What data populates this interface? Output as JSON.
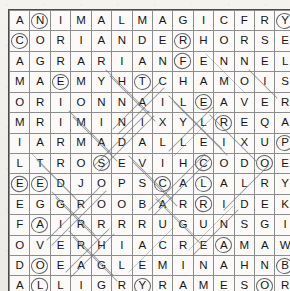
{
  "puzzle": {
    "type": "word-search",
    "rows": 14,
    "cols": 14,
    "title": "Animal Magic word search grid",
    "grid": [
      [
        "A",
        "N",
        "I",
        "M",
        "A",
        "L",
        "M",
        "A",
        "G",
        "I",
        "C",
        "F",
        "R",
        "Y"
      ],
      [
        "C",
        "O",
        "R",
        "I",
        "A",
        "N",
        "D",
        "E",
        "R",
        "H",
        "O",
        "R",
        "S",
        "E"
      ],
      [
        "A",
        "G",
        "R",
        "A",
        "R",
        "I",
        "A",
        "N",
        "F",
        "E",
        "N",
        "N",
        "E",
        "L"
      ],
      [
        "M",
        "A",
        "E",
        "M",
        "Y",
        "H",
        "T",
        "C",
        "H",
        "A",
        "M",
        "O",
        "I",
        "S"
      ],
      [
        "O",
        "R",
        "I",
        "O",
        "N",
        "N",
        "A",
        "I",
        "L",
        "E",
        "A",
        "V",
        "E",
        "R"
      ],
      [
        "M",
        "R",
        "I",
        "M",
        "I",
        "N",
        "I",
        "X",
        "Y",
        "L",
        "R",
        "E",
        "Q",
        "A"
      ],
      [
        "I",
        "A",
        "R",
        "M",
        "A",
        "D",
        "A",
        "L",
        "L",
        "E",
        "I",
        "X",
        "U",
        "P"
      ],
      [
        "L",
        "T",
        "R",
        "O",
        "S",
        "E",
        "V",
        "I",
        "H",
        "C",
        "O",
        "D",
        "O",
        "E"
      ],
      [
        "E",
        "E",
        "D",
        "J",
        "O",
        "P",
        "S",
        "C",
        "A",
        "L",
        "A",
        "L",
        "R",
        "Y"
      ],
      [
        "E",
        "G",
        "G",
        "R",
        "O",
        "O",
        "B",
        "A",
        "R",
        "R",
        "I",
        "D",
        "E",
        "K"
      ],
      [
        "F",
        "A",
        "I",
        "R",
        "R",
        "R",
        "R",
        "U",
        "G",
        "U",
        "N",
        "S",
        "G",
        "I"
      ],
      [
        "O",
        "V",
        "E",
        "R",
        "H",
        "I",
        "A",
        "C",
        "R",
        "E",
        "A",
        "M",
        "A",
        "W"
      ],
      [
        "D",
        "O",
        "E",
        "A",
        "G",
        "L",
        "E",
        "M",
        "I",
        "N",
        "A",
        "H",
        "N",
        "B"
      ],
      [
        "A",
        "L",
        "L",
        "I",
        "G",
        "R",
        "Y",
        "R",
        "A",
        "M",
        "E",
        "S",
        "O",
        "R"
      ]
    ],
    "circled_cells": [
      [
        0,
        1
      ],
      [
        0,
        13
      ],
      [
        1,
        0
      ],
      [
        1,
        8
      ],
      [
        2,
        8
      ],
      [
        3,
        2
      ],
      [
        3,
        6
      ],
      [
        4,
        9
      ],
      [
        5,
        10
      ],
      [
        6,
        13
      ],
      [
        7,
        4
      ],
      [
        7,
        9
      ],
      [
        7,
        12
      ],
      [
        8,
        0
      ],
      [
        8,
        1
      ],
      [
        8,
        7
      ],
      [
        8,
        9
      ],
      [
        9,
        9
      ],
      [
        10,
        1
      ],
      [
        11,
        10
      ],
      [
        12,
        1
      ],
      [
        12,
        13
      ],
      [
        13,
        1
      ],
      [
        13,
        6
      ],
      [
        13,
        12
      ]
    ],
    "colors": {
      "paper": "#f2f1ee",
      "cell": "#fbfaf8",
      "gridline": "#8d8d8d",
      "letter": "#15161a",
      "pencil": "#6f737c",
      "ring": "#4b4f58"
    }
  }
}
